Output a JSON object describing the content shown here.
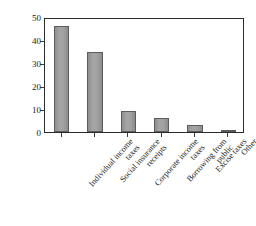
{
  "chart_data": {
    "type": "bar",
    "title": "",
    "subtitle": "",
    "xlabel": "",
    "ylabel": "Percentage",
    "ylim": [
      0,
      50
    ],
    "yticks": [
      0,
      10,
      20,
      30,
      40,
      50
    ],
    "ytick_labels": [
      "0",
      "10",
      "20",
      "30",
      "40",
      "50"
    ],
    "grid": false,
    "legend": null,
    "bar_color": "#9b9b9b",
    "bar_edge_color": "#5c5c5c",
    "axis_color": "#2b2b2b",
    "background": "#ffffff",
    "categories": [
      "Individual income taxes",
      "Social insurance receipts",
      "Corporate income taxes",
      "Borrowing from public",
      "Excise taxes",
      "Other"
    ],
    "category_lines": [
      [
        "Individual income",
        "taxes"
      ],
      [
        "Social insurance",
        "receipts"
      ],
      [
        "Corporate income",
        "taxes"
      ],
      [
        "Borrowing from",
        "public"
      ],
      [
        "Excise taxes",
        ""
      ],
      [
        "Other",
        ""
      ]
    ],
    "values": [
      46,
      35,
      9,
      6,
      3,
      1
    ]
  }
}
